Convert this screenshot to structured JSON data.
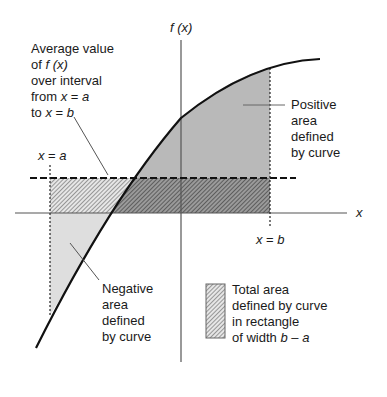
{
  "axes": {
    "y_label_f": "f",
    "y_label_x": "(x)",
    "x_label": "x"
  },
  "markers": {
    "a": {
      "lhs": "x",
      "eq": " = ",
      "rhs": "a"
    },
    "b": {
      "lhs": "x",
      "eq": " = ",
      "rhs": "b"
    }
  },
  "annotations": {
    "average": {
      "line1": "Average value",
      "line2_pre": "of ",
      "line2_f": "f",
      "line2_x": " (x)",
      "line3": "over interval",
      "line4_pre": "from ",
      "line4_x": "x",
      "line4_eq": " = ",
      "line4_a": "a",
      "line5_pre": "to ",
      "line5_x": "x",
      "line5_eq": " = ",
      "line5_b": "b"
    },
    "positive": [
      "Positive",
      "area",
      "defined",
      "by curve"
    ],
    "negative": [
      "Negative",
      "area",
      "defined",
      "by curve"
    ]
  },
  "legend": {
    "line1": "Total area",
    "line2": "defined by curve",
    "line3": "in rectangle",
    "line4_pre": "of width ",
    "line4_b": "b",
    "line4_dash": " – ",
    "line4_a": "a"
  },
  "colors": {
    "positive_fill": "#b3b3b3",
    "negative_fill": "#dcdcdc",
    "hatch_dark": "#555555",
    "curve": "#111111",
    "axis": "#555555"
  }
}
